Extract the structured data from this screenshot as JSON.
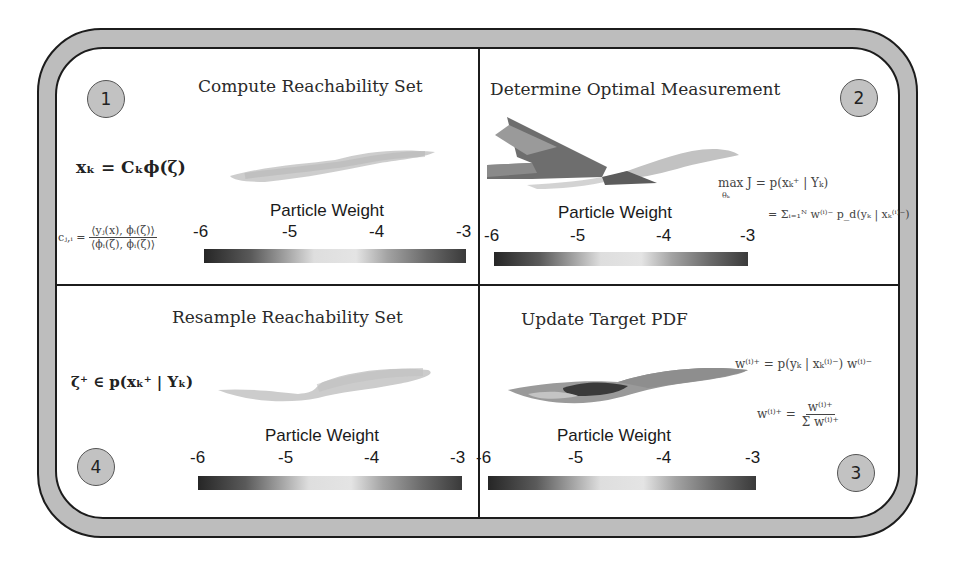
{
  "panels": [
    {
      "step": "1",
      "title": "Compute Reachability Set",
      "equation_main": "xₖ = Cₖϕ(ζ)",
      "equation_coef_lhs": "cⱼ,ᵢ =",
      "equation_coef_num": "⟨yⱼ(x), ϕᵢ(ζ)⟩",
      "equation_coef_den": "⟨ϕᵢ(ζ), ϕᵢ(ζ)⟩",
      "colorbar": {
        "label": "Particle Weight",
        "ticks": [
          "-6",
          "-5",
          "-4",
          "-3"
        ]
      }
    },
    {
      "step": "2",
      "title": "Determine Optimal Measurement",
      "equation_line1": "max J = p(xₖ⁺ | Yₖ)",
      "equation_line1_sub": "θₖ",
      "equation_line2": "= Σᵢ₌₁ᴺ w⁽ⁱ⁾⁻ p_d(yₖ | xₖ⁽ⁱ⁾⁻)",
      "colorbar": {
        "label": "Particle Weight",
        "ticks": [
          "-6",
          "-5",
          "-4",
          "-3"
        ]
      }
    },
    {
      "step": "3",
      "title": "Update Target PDF",
      "equation_line1": "w⁽ⁱ⁾⁺ = p(yₖ | xₖ⁽ⁱ⁾⁻) w⁽ⁱ⁾⁻",
      "equation_lhs": "w⁽ⁱ⁾⁺ =",
      "equation_num": "w⁽ⁱ⁾⁺",
      "equation_den": "Σ w⁽ⁱ⁾⁺",
      "colorbar": {
        "label": "Particle Weight",
        "ticks": [
          "-6",
          "-5",
          "-4",
          "-3"
        ]
      }
    },
    {
      "step": "4",
      "title": "Resample Reachability Set",
      "equation_main": "ζ⁺ ∈ p(xₖ⁺ | Yₖ)",
      "colorbar": {
        "label": "Particle Weight",
        "ticks": [
          "-6",
          "-5",
          "-4",
          "-3"
        ]
      }
    }
  ],
  "colors": {
    "frame_fill": "#bdbdbd",
    "frame_stroke": "#1c1c1c",
    "badge_fill": "#c2c2c2",
    "colorbar_low": "#262626",
    "colorbar_mid": "#e4e4e4",
    "colorbar_high": "#3a3a3a"
  }
}
